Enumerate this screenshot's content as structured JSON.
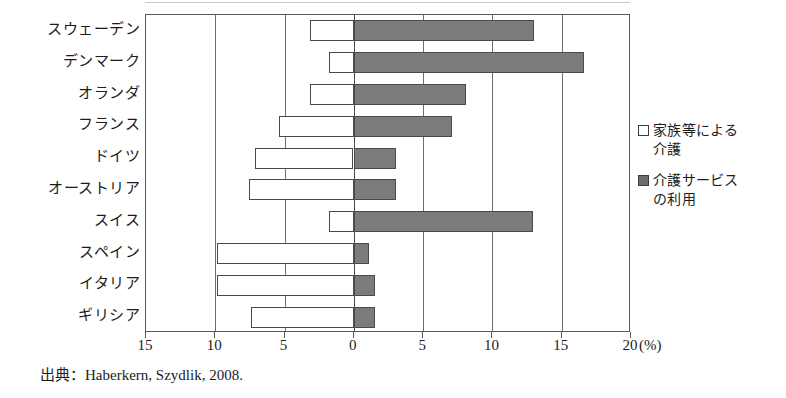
{
  "source_note": "出典：Haberkern, Szydlik, 2008.",
  "axis": {
    "unit_label": "(%)",
    "tick_labels": [
      "15",
      "10",
      "5",
      "0",
      "5",
      "10",
      "15",
      "20"
    ],
    "tick_values": [
      -15,
      -10,
      -5,
      0,
      5,
      10,
      15,
      20
    ],
    "min": -15,
    "max": 20
  },
  "legend": {
    "items": [
      {
        "marker": "open-square-swatch",
        "label": "家族等による\n介護"
      },
      {
        "marker": "filled-square-swatch",
        "label": "介護サービス\nの利用"
      }
    ]
  },
  "colors": {
    "family_care_fill": "#ffffff",
    "service_use_fill": "#7b7b7b",
    "bar_border": "#4a4a4a",
    "gridline": "#6e6e6e",
    "frame": "#5a5a5a"
  },
  "chart_data": {
    "type": "bar",
    "title": "",
    "subtitle": "",
    "orientation": "horizontal",
    "layout": "diverging",
    "xlabel": "(%)",
    "ylabel": "",
    "xlim": [
      -15,
      20
    ],
    "grid": true,
    "legend_position": "right",
    "categories": [
      "スウェーデン",
      "デンマーク",
      "オランダ",
      "フランス",
      "ドイツ",
      "オーストリア",
      "スイス",
      "スペイン",
      "イタリア",
      "ギリシア"
    ],
    "series": [
      {
        "name": "家族等による介護",
        "direction": "left",
        "values": [
          3.2,
          1.8,
          3.2,
          5.4,
          7.1,
          7.6,
          1.8,
          9.9,
          9.9,
          7.4
        ]
      },
      {
        "name": "介護サービスの利用",
        "direction": "right",
        "values": [
          13.0,
          16.6,
          8.1,
          7.1,
          3.0,
          3.0,
          12.9,
          1.1,
          1.5,
          1.5
        ]
      }
    ],
    "annotations": [
      "出典：Haberkern, Szydlik, 2008."
    ]
  }
}
